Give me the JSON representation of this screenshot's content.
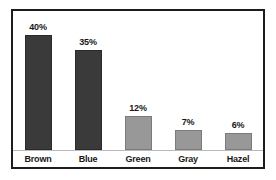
{
  "chart_data": {
    "type": "bar",
    "title": "",
    "subtitle": "",
    "xlabel": "",
    "ylabel": "",
    "categories": [
      "Brown",
      "Blue",
      "Green",
      "Gray",
      "Hazel"
    ],
    "values": [
      40,
      35,
      12,
      7,
      6
    ],
    "value_labels": [
      "40%",
      "35%",
      "12%",
      "7%",
      "6%"
    ],
    "ylim": [
      0,
      44
    ],
    "grid": false,
    "legend": false,
    "legend_position": "none",
    "bar_colors": [
      "#3a3a3a",
      "#3a3a3a",
      "#989898",
      "#989898",
      "#989898"
    ],
    "colors": {
      "dark_bar": "#3a3a3a",
      "light_bar": "#989898",
      "frame": "#1d1d1d",
      "axis_line": "#b9b9b9",
      "text": "#171717",
      "background": "#ffffff"
    }
  },
  "bars": [
    {
      "category": "Brown",
      "value": 40,
      "label": "40%",
      "tone": "dark"
    },
    {
      "category": "Blue",
      "value": 35,
      "label": "35%",
      "tone": "dark"
    },
    {
      "category": "Green",
      "value": 12,
      "label": "12%",
      "tone": "light"
    },
    {
      "category": "Gray",
      "value": 7,
      "label": "7%",
      "tone": "light"
    },
    {
      "category": "Hazel",
      "value": 6,
      "label": "6%",
      "tone": "light"
    }
  ]
}
